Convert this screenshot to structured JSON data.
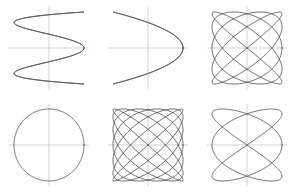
{
  "figure": {
    "background_color": "#ffffff",
    "axis_color": "#c8c8c8",
    "curve_color": "#4a4a4a",
    "axis_stroke_width": 0.8,
    "curve_stroke_width": 0.85,
    "rows": 2,
    "columns": 3,
    "cell_width": 98,
    "cell_height": 96
  },
  "chart_data": {
    "type": "line",
    "subtitle": "Parametric curves x = A sin(a t + d), y = B sin(b t)",
    "xlabel": "",
    "ylabel": "",
    "grid": false,
    "legend_position": "none",
    "axes_style": "centered-cross",
    "xlim": [
      -1,
      1
    ],
    "ylim": [
      -1,
      1
    ],
    "panels": [
      {
        "index": 0,
        "row": 0,
        "column": 0,
        "name": "lissajous-4-1",
        "ratio_label": "4:1",
        "freq_x": 4,
        "freq_y": 1,
        "phase_deg": 90,
        "amplitude_x": 1,
        "amplitude_y": 1,
        "lobes_horizontal": 4,
        "lobes_vertical": 1,
        "description": "Four tall vertical lobes; x oscillates four times per y cycle"
      },
      {
        "index": 1,
        "row": 0,
        "column": 1,
        "name": "lissajous-2-1",
        "ratio_label": "2:1",
        "freq_x": 2,
        "freq_y": 1,
        "phase_deg": 90,
        "amplitude_x": 1,
        "amplitude_y": 1,
        "lobes_horizontal": 2,
        "lobes_vertical": 1,
        "description": "Classic figure-eight crossing at the origin"
      },
      {
        "index": 2,
        "row": 0,
        "column": 2,
        "name": "lissajous-5-4",
        "ratio_label": "5:4",
        "freq_x": 5,
        "freq_y": 4,
        "phase_deg": 90,
        "amplitude_x": 1,
        "amplitude_y": 1,
        "lobes_horizontal": 5,
        "lobes_vertical": 4,
        "description": "Open lattice weave filling a rounded square"
      },
      {
        "index": 3,
        "row": 1,
        "column": 0,
        "name": "lissajous-1-1",
        "ratio_label": "1:1",
        "freq_x": 1,
        "freq_y": 1,
        "phase_deg": 90,
        "amplitude_x": 1,
        "amplitude_y": 1,
        "lobes_horizontal": 1,
        "lobes_vertical": 1,
        "description": "Perfect circle from equal frequencies at quarter-cycle phase"
      },
      {
        "index": 4,
        "row": 1,
        "column": 1,
        "name": "lissajous-7-6",
        "ratio_label": "7:6",
        "freq_x": 7,
        "freq_y": 6,
        "phase_deg": 90,
        "amplitude_x": 1,
        "amplitude_y": 1,
        "lobes_horizontal": 7,
        "lobes_vertical": 6,
        "description": "Dense fine lattice nearly filling the square"
      },
      {
        "index": 5,
        "row": 1,
        "column": 2,
        "name": "lissajous-3-2",
        "ratio_label": "3:2",
        "freq_x": 3,
        "freq_y": 2,
        "phase_deg": 90,
        "amplitude_x": 1,
        "amplitude_y": 1,
        "lobes_horizontal": 3,
        "lobes_vertical": 2,
        "description": "Three horizontal lobes over two vertical lobes"
      }
    ]
  }
}
